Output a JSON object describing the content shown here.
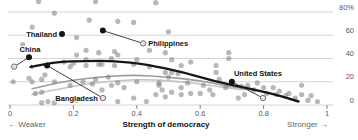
{
  "colors": {
    "background": "#ffffff",
    "grid": "#c9c9c9",
    "axis_text": "#595959",
    "dot": "#767676",
    "highlight": "#141414",
    "ring_fill": "#e4e4e4",
    "ring_stroke": "#6e6e6e",
    "arrow": "#2b2b2b",
    "label": "#111111",
    "trend_dark": "#161616",
    "trend_gray": "#9c9c9c",
    "trend_gray_light": "#c4c4c4"
  },
  "chart_data": {
    "type": "scatter",
    "title": "",
    "xlabel": "Strength of democracy",
    "ylabel": "",
    "x_axis_hints": {
      "left": "← Weaker",
      "right": "Stronger →"
    },
    "xlim": [
      0,
      1
    ],
    "ylim": [
      0,
      80
    ],
    "grid": "horizontal",
    "x_ticks": {
      "values": [
        0,
        0.2,
        0.4,
        0.6,
        0.8,
        1
      ],
      "labels": [
        "0",
        "0.2",
        "0.4",
        "0.6",
        "0.8",
        "1"
      ]
    },
    "y_ticks": {
      "values": [
        0,
        20,
        40,
        60,
        80
      ],
      "labels": [
        "0",
        "20",
        "40",
        "60",
        "80%"
      ]
    },
    "points": [
      [
        0.09,
        89
      ],
      [
        0.27,
        89
      ],
      [
        0.46,
        88
      ],
      [
        0.14,
        79
      ],
      [
        0.25,
        73
      ],
      [
        0.34,
        72
      ],
      [
        0.39,
        71
      ],
      [
        0.07,
        67
      ],
      [
        0.5,
        63
      ],
      [
        0.21,
        58
      ],
      [
        0.04,
        52
      ],
      [
        0.24,
        47
      ],
      [
        0.44,
        47
      ],
      [
        0.33,
        46
      ],
      [
        0.28,
        45
      ],
      [
        0.49,
        45
      ],
      [
        0.69,
        45
      ],
      [
        0.21,
        43
      ],
      [
        0.34,
        43
      ],
      [
        0.69,
        40
      ],
      [
        0.4,
        39
      ],
      [
        0.32,
        40
      ],
      [
        0.24,
        39
      ],
      [
        0.51,
        39
      ],
      [
        0.17,
        37
      ],
      [
        0.57,
        37
      ],
      [
        0.2,
        36
      ],
      [
        0.28,
        35
      ],
      [
        0.39,
        35
      ],
      [
        0.29,
        35
      ],
      [
        0.65,
        34
      ],
      [
        0.33,
        34
      ],
      [
        0.24,
        34
      ],
      [
        0.54,
        34
      ],
      [
        0.44,
        33
      ],
      [
        0.19,
        33
      ],
      [
        0.49,
        28
      ],
      [
        0.53,
        27
      ],
      [
        0.65,
        28
      ],
      [
        0.51,
        28
      ],
      [
        0.66,
        22
      ],
      [
        0.11,
        26
      ],
      [
        0.06,
        23
      ],
      [
        0.1,
        22
      ],
      [
        0.27,
        22
      ],
      [
        0.31,
        24
      ],
      [
        0.5,
        24
      ],
      [
        0.07,
        20
      ],
      [
        0.01,
        20
      ],
      [
        0.14,
        20
      ],
      [
        0.23,
        20
      ],
      [
        0.4,
        20
      ],
      [
        0.34,
        19
      ],
      [
        0.47,
        19
      ],
      [
        0.56,
        19
      ],
      [
        0.19,
        17
      ],
      [
        0.26,
        18
      ],
      [
        0.32,
        17
      ],
      [
        0.36,
        15
      ],
      [
        0.47,
        17
      ],
      [
        0.51,
        11
      ],
      [
        0.46,
        9
      ],
      [
        0.6,
        10
      ],
      [
        0.63,
        13
      ],
      [
        0.54,
        15
      ],
      [
        0.48,
        13
      ],
      [
        0.61,
        17
      ],
      [
        0.68,
        15
      ],
      [
        0.57,
        10
      ],
      [
        0.64,
        9
      ],
      [
        0.08,
        10
      ],
      [
        0.1,
        11
      ],
      [
        0.29,
        13
      ],
      [
        0.54,
        9
      ],
      [
        0.1,
        2
      ],
      [
        0.12,
        3
      ],
      [
        0.14,
        2
      ],
      [
        0.21,
        4
      ],
      [
        0.34,
        3
      ],
      [
        0.39,
        6
      ],
      [
        0.43,
        3
      ],
      [
        0.49,
        7
      ],
      [
        0.73,
        16
      ],
      [
        0.75,
        17
      ],
      [
        0.77,
        13
      ],
      [
        0.78,
        19
      ],
      [
        0.8,
        15
      ],
      [
        0.81,
        10
      ],
      [
        0.83,
        15
      ],
      [
        0.84,
        9
      ],
      [
        0.85,
        12
      ],
      [
        0.87,
        8
      ],
      [
        0.88,
        10
      ],
      [
        0.9,
        6
      ],
      [
        0.92,
        9
      ],
      [
        0.94,
        4
      ],
      [
        0.95,
        8
      ],
      [
        0.97,
        3
      ],
      [
        0.74,
        9
      ],
      [
        0.72,
        6
      ],
      [
        0.92,
        17
      ]
    ],
    "highlighted_countries": [
      {
        "name": "China",
        "x": 0.06,
        "y": 41,
        "to": {
          "x": 0.013,
          "y": 33
        },
        "label_side": "above"
      },
      {
        "name": "Thailand",
        "x": 0.164,
        "y": 61,
        "to": null,
        "label_side": "left"
      },
      {
        "name": "Philippines",
        "x": 0.293,
        "y": 64,
        "to": {
          "x": 0.42,
          "y": 53
        },
        "label_side": "right-of-end"
      },
      {
        "name": "Bangladesh",
        "x": 0.117,
        "y": 34,
        "to": {
          "x": 0.293,
          "y": 6
        },
        "label_side": "left-of-end"
      },
      {
        "name": "United States",
        "x": 0.7,
        "y": 20,
        "to": {
          "x": 0.798,
          "y": 6
        },
        "label_side": "above-start"
      }
    ],
    "trend_lines": [
      {
        "name": "gray-trend-upper",
        "color_key": "trend_gray",
        "width": 1.6,
        "arrow_start": false,
        "points": [
          [
            0.07,
            14
          ],
          [
            0.16,
            20
          ],
          [
            0.27,
            24
          ],
          [
            0.39,
            26
          ],
          [
            0.5,
            24
          ],
          [
            0.6,
            21
          ],
          [
            0.69,
            16
          ],
          [
            0.77,
            13
          ]
        ]
      },
      {
        "name": "gray-trend-lower",
        "color_key": "trend_gray_light",
        "width": 1.6,
        "arrow_start": false,
        "points": [
          [
            0.07,
            9
          ],
          [
            0.19,
            16
          ],
          [
            0.32,
            21
          ],
          [
            0.44,
            22
          ],
          [
            0.55,
            20
          ],
          [
            0.65,
            16
          ],
          [
            0.74,
            13
          ]
        ]
      },
      {
        "name": "black-trend",
        "color_key": "trend_dark",
        "width": 2.4,
        "arrow_start": true,
        "points": [
          [
            0.07,
            33
          ],
          [
            0.14,
            37
          ],
          [
            0.24,
            38
          ],
          [
            0.33,
            38
          ],
          [
            0.43,
            35
          ],
          [
            0.55,
            28
          ],
          [
            0.65,
            20
          ],
          [
            0.74,
            15
          ],
          [
            0.84,
            9
          ],
          [
            0.91,
            3
          ]
        ]
      }
    ]
  }
}
